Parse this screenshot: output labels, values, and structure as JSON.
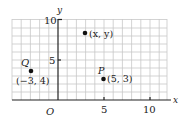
{
  "diagram": {
    "type": "coordinate-plane",
    "axes": {
      "x_label": "x",
      "y_label": "y",
      "origin_label": "O",
      "x_ticks": [
        {
          "value": 5,
          "label": "5"
        },
        {
          "value": 10,
          "label": "10"
        }
      ],
      "y_ticks": [
        {
          "value": 5,
          "label": "5"
        },
        {
          "value": 10,
          "label": "10"
        }
      ],
      "x_range": [
        -5,
        11
      ],
      "y_range": [
        0,
        10
      ]
    },
    "points": [
      {
        "name": "",
        "coords_label": "(x, y)",
        "x": 2,
        "y": 8.6
      },
      {
        "name": "P",
        "coords_label": "(5, 3)",
        "x": 5,
        "y": 3
      },
      {
        "name": "Q",
        "coords_label": "(−3, 4)",
        "x": -3,
        "y": 4
      }
    ],
    "colors": {
      "grid": "#c8c8c8",
      "axis": "#222222",
      "point": "#111111"
    }
  }
}
